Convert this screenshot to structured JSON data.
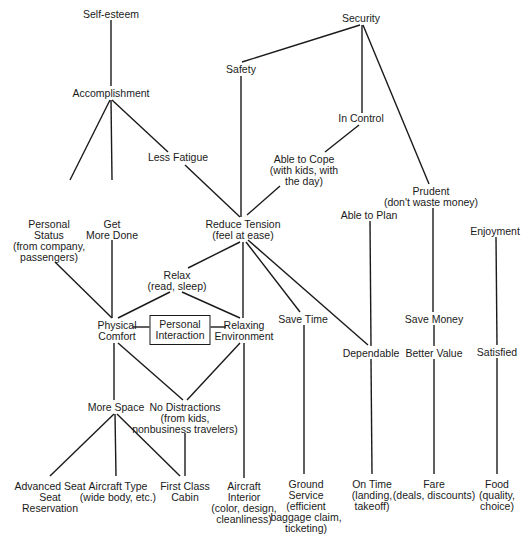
{
  "diagram": {
    "type": "hierarchical-value-map",
    "nodes": [
      {
        "id": "self-esteem",
        "label": "Self-esteem",
        "x": 111,
        "y": 9
      },
      {
        "id": "security",
        "label": "Security",
        "x": 361,
        "y": 13
      },
      {
        "id": "safety",
        "label": "Safety",
        "x": 241,
        "y": 64
      },
      {
        "id": "accomplishment",
        "label": "Accomplishment",
        "x": 111,
        "y": 88
      },
      {
        "id": "in-control",
        "label": "In Control",
        "x": 361,
        "y": 113
      },
      {
        "id": "less-fatigue",
        "label": "Less Fatigue",
        "x": 178,
        "y": 152
      },
      {
        "id": "able-to-cope",
        "label": "Able to Cope\n(with kids, with\nthe day)",
        "x": 304,
        "y": 154
      },
      {
        "id": "prudent",
        "label": "Prudent\n(don't waste money)",
        "x": 431,
        "y": 186
      },
      {
        "id": "personal-status",
        "label": "Personal\nStatus\n(from company,\npassengers)",
        "x": 49,
        "y": 219
      },
      {
        "id": "get-more-done",
        "label": "Get\nMore Done",
        "x": 112,
        "y": 219
      },
      {
        "id": "reduce-tension",
        "label": "Reduce Tension\n(feel at ease)",
        "x": 243,
        "y": 219
      },
      {
        "id": "able-to-plan",
        "label": "Able to Plan",
        "x": 369,
        "y": 210
      },
      {
        "id": "enjoyment",
        "label": "Enjoyment",
        "x": 495,
        "y": 226
      },
      {
        "id": "relax",
        "label": "Relax\n(read, sleep)",
        "x": 177,
        "y": 270
      },
      {
        "id": "physical-comfort",
        "label": "Physical\nComfort",
        "x": 117,
        "y": 320
      },
      {
        "id": "personal-interaction",
        "label": "Personal\nInteraction",
        "x": 180,
        "y": 315,
        "boxed": true
      },
      {
        "id": "relaxing-environment",
        "label": "Relaxing\nEnvironment",
        "x": 244,
        "y": 320
      },
      {
        "id": "save-time",
        "label": "Save Time",
        "x": 303,
        "y": 314
      },
      {
        "id": "save-money",
        "label": "Save Money",
        "x": 434,
        "y": 314
      },
      {
        "id": "dependable",
        "label": "Dependable",
        "x": 371,
        "y": 348
      },
      {
        "id": "better-value",
        "label": "Better Value",
        "x": 434,
        "y": 348
      },
      {
        "id": "satisfied",
        "label": "Satisfied",
        "x": 497,
        "y": 347
      },
      {
        "id": "more-space",
        "label": "More Space",
        "x": 116,
        "y": 402
      },
      {
        "id": "no-distractions",
        "label": "No Distractions\n(from kids,\nnonbusiness travelers)",
        "x": 185,
        "y": 402
      },
      {
        "id": "advanced-seat-reservation",
        "label": "Advanced Seat\nSeat\nReservation",
        "x": 50,
        "y": 481
      },
      {
        "id": "aircraft-type",
        "label": "Aircraft Type\n(wide body, etc.)",
        "x": 118,
        "y": 481
      },
      {
        "id": "first-class-cabin",
        "label": "First Class\nCabin",
        "x": 185,
        "y": 481
      },
      {
        "id": "aircraft-interior",
        "label": "Aircraft\nInterior\n(color, design,\ncleanliness)",
        "x": 244,
        "y": 481
      },
      {
        "id": "ground-service",
        "label": "Ground\nService\n(efficient\nbaggage claim,\nticketing)",
        "x": 306,
        "y": 479
      },
      {
        "id": "on-time",
        "label": "On Time\n(landing,\ntakeoff)",
        "x": 372,
        "y": 479
      },
      {
        "id": "fare",
        "label": "Fare\n(deals, discounts)",
        "x": 434,
        "y": 479
      },
      {
        "id": "food",
        "label": "Food\n(quality,\nchoice)",
        "x": 497,
        "y": 479
      }
    ],
    "edges": [
      {
        "from": "self-esteem",
        "to": "accomplishment",
        "x1": 111,
        "y1": 20,
        "x2": 111,
        "y2": 86
      },
      {
        "from": "security",
        "to": "safety",
        "x1": 360,
        "y1": 25,
        "x2": 242,
        "y2": 62
      },
      {
        "from": "security",
        "to": "in-control",
        "x1": 362,
        "y1": 25,
        "x2": 362,
        "y2": 113
      },
      {
        "from": "security",
        "to": "prudent",
        "x1": 363,
        "y1": 25,
        "x2": 429,
        "y2": 184
      },
      {
        "from": "accomplishment",
        "to": "personal-status",
        "x1": 110,
        "y1": 100,
        "x2": 70,
        "y2": 180
      },
      {
        "from": "accomplishment",
        "to": "get-more-done",
        "x1": 111,
        "y1": 100,
        "x2": 112,
        "y2": 180
      },
      {
        "from": "accomplishment",
        "to": "less-fatigue",
        "x1": 112,
        "y1": 100,
        "x2": 168,
        "y2": 152
      },
      {
        "from": "less-fatigue",
        "to": "reduce-tension",
        "x1": 185,
        "y1": 165,
        "x2": 240,
        "y2": 217
      },
      {
        "from": "safety",
        "to": "reduce-tension",
        "x1": 241,
        "y1": 76,
        "x2": 241,
        "y2": 217
      },
      {
        "from": "in-control",
        "to": "able-to-cope",
        "x1": 359,
        "y1": 125,
        "x2": 325,
        "y2": 152
      },
      {
        "from": "able-to-cope",
        "to": "reduce-tension",
        "x1": 280,
        "y1": 186,
        "x2": 247,
        "y2": 215
      },
      {
        "from": "prudent",
        "to": "save-money",
        "x1": 433,
        "y1": 208,
        "x2": 433,
        "y2": 312
      },
      {
        "from": "able-to-plan",
        "to": "dependable",
        "x1": 370,
        "y1": 221,
        "x2": 371,
        "y2": 346
      },
      {
        "from": "enjoyment",
        "to": "satisfied",
        "x1": 496,
        "y1": 237,
        "x2": 497,
        "y2": 345
      },
      {
        "from": "personal-status",
        "to": "physical-comfort",
        "x1": 55,
        "y1": 262,
        "x2": 112,
        "y2": 318
      },
      {
        "from": "get-more-done",
        "to": "physical-comfort",
        "x1": 112,
        "y1": 240,
        "x2": 112,
        "y2": 318
      },
      {
        "from": "reduce-tension",
        "to": "relax",
        "x1": 240,
        "y1": 242,
        "x2": 188,
        "y2": 268
      },
      {
        "from": "reduce-tension",
        "to": "relaxing-environment",
        "x1": 243,
        "y1": 242,
        "x2": 243,
        "y2": 318
      },
      {
        "from": "reduce-tension",
        "to": "save-time",
        "x1": 246,
        "y1": 242,
        "x2": 300,
        "y2": 312
      },
      {
        "from": "reduce-tension",
        "to": "dependable",
        "x1": 248,
        "y1": 240,
        "x2": 368,
        "y2": 345
      },
      {
        "from": "relax",
        "to": "physical-comfort",
        "x1": 170,
        "y1": 292,
        "x2": 118,
        "y2": 318
      },
      {
        "from": "relax",
        "to": "relaxing-environment",
        "x1": 182,
        "y1": 292,
        "x2": 240,
        "y2": 318
      },
      {
        "from": "physical-comfort",
        "to": "personal-interaction",
        "x1": 133,
        "y1": 327,
        "x2": 152,
        "y2": 327
      },
      {
        "from": "personal-interaction",
        "to": "relaxing-environment",
        "x1": 207,
        "y1": 327,
        "x2": 226,
        "y2": 327
      },
      {
        "from": "physical-comfort",
        "to": "more-space",
        "x1": 114,
        "y1": 343,
        "x2": 114,
        "y2": 400
      },
      {
        "from": "physical-comfort",
        "to": "no-distractions",
        "x1": 118,
        "y1": 343,
        "x2": 183,
        "y2": 400
      },
      {
        "from": "relaxing-environment",
        "to": "no-distractions",
        "x1": 240,
        "y1": 343,
        "x2": 187,
        "y2": 400
      },
      {
        "from": "relaxing-environment",
        "to": "aircraft-interior",
        "x1": 244,
        "y1": 343,
        "x2": 244,
        "y2": 478
      },
      {
        "from": "save-time",
        "to": "ground-service",
        "x1": 304,
        "y1": 325,
        "x2": 304,
        "y2": 474
      },
      {
        "from": "dependable",
        "to": "on-time",
        "x1": 371,
        "y1": 359,
        "x2": 372,
        "y2": 474
      },
      {
        "from": "save-money",
        "to": "better-value",
        "x1": 434,
        "y1": 325,
        "x2": 434,
        "y2": 346
      },
      {
        "from": "better-value",
        "to": "fare",
        "x1": 434,
        "y1": 359,
        "x2": 434,
        "y2": 474
      },
      {
        "from": "satisfied",
        "to": "food",
        "x1": 497,
        "y1": 358,
        "x2": 497,
        "y2": 474
      },
      {
        "from": "more-space",
        "to": "advanced-seat-reservation",
        "x1": 114,
        "y1": 414,
        "x2": 50,
        "y2": 476
      },
      {
        "from": "more-space",
        "to": "aircraft-type",
        "x1": 115,
        "y1": 414,
        "x2": 116,
        "y2": 476
      },
      {
        "from": "more-space",
        "to": "first-class-cabin",
        "x1": 117,
        "y1": 414,
        "x2": 180,
        "y2": 476
      },
      {
        "from": "no-distractions",
        "to": "first-class-cabin",
        "x1": 185,
        "y1": 433,
        "x2": 185,
        "y2": 476
      }
    ]
  }
}
